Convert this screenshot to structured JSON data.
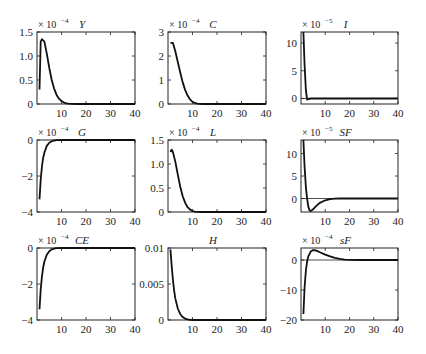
{
  "chart_data": [
    {
      "type": "line",
      "title": "Y",
      "exponent": "-4",
      "xlim": [
        0,
        40
      ],
      "ylim": [
        0,
        1.5
      ],
      "xticks": [
        10,
        20,
        30,
        40
      ],
      "yticks": [
        0,
        0.5,
        1.0,
        1.5
      ],
      "ytick_labels": [
        "0",
        "0.5",
        "1.0",
        "1.5"
      ],
      "zero_line": false,
      "x": [
        1,
        1.5,
        2,
        3,
        4,
        5,
        6,
        7,
        8,
        9,
        10,
        11,
        12,
        13,
        14,
        16,
        20,
        30,
        40
      ],
      "values": [
        0.3,
        1.3,
        1.35,
        1.3,
        1.05,
        0.75,
        0.5,
        0.32,
        0.19,
        0.11,
        0.06,
        0.03,
        0.015,
        0.006,
        0.002,
        0,
        0,
        0,
        0
      ]
    },
    {
      "type": "line",
      "title": "C",
      "exponent": "-4",
      "xlim": [
        0,
        40
      ],
      "ylim": [
        0,
        3
      ],
      "xticks": [
        10,
        20,
        30,
        40
      ],
      "yticks": [
        0,
        1,
        2,
        3
      ],
      "ytick_labels": [
        "0",
        "1",
        "2",
        "3"
      ],
      "zero_line": false,
      "x": [
        1,
        2,
        3,
        4,
        5,
        6,
        7,
        8,
        9,
        10,
        11,
        12,
        13,
        14,
        16,
        20,
        30,
        40
      ],
      "values": [
        2.55,
        2.55,
        2.2,
        1.75,
        1.3,
        0.9,
        0.58,
        0.35,
        0.19,
        0.09,
        0.04,
        0.015,
        0.005,
        0,
        0,
        0,
        0,
        0
      ]
    },
    {
      "type": "line",
      "title": "I",
      "exponent": "-5",
      "xlim": [
        0,
        40
      ],
      "ylim": [
        -1,
        12
      ],
      "xticks": [
        10,
        20,
        30,
        40
      ],
      "yticks": [
        0,
        5,
        10
      ],
      "ytick_labels": [
        "0",
        "5",
        "10"
      ],
      "zero_line": true,
      "x": [
        1,
        1.5,
        2,
        2.5,
        3,
        4,
        6,
        10,
        20,
        40
      ],
      "values": [
        12,
        6,
        1.5,
        -0.2,
        -0.1,
        0,
        0,
        0,
        0,
        0
      ]
    },
    {
      "type": "line",
      "title": "G",
      "exponent": "-4",
      "xlim": [
        0,
        40
      ],
      "ylim": [
        -4,
        0
      ],
      "xticks": [
        10,
        20,
        30,
        40
      ],
      "yticks": [
        -4,
        -2,
        0
      ],
      "ytick_labels": [
        "-4",
        "-2",
        "0"
      ],
      "zero_line": false,
      "x": [
        1,
        1.5,
        2,
        2.5,
        3,
        4,
        5,
        6,
        7,
        8,
        10,
        20,
        40
      ],
      "values": [
        -3.3,
        -2.2,
        -1.5,
        -1.0,
        -0.7,
        -0.33,
        -0.15,
        -0.07,
        -0.03,
        -0.01,
        0,
        0,
        0
      ]
    },
    {
      "type": "line",
      "title": "L",
      "exponent": "-4",
      "xlim": [
        0,
        40
      ],
      "ylim": [
        0,
        1.5
      ],
      "xticks": [
        10,
        20,
        30,
        40
      ],
      "yticks": [
        0,
        0.5,
        1.0,
        1.5
      ],
      "ytick_labels": [
        "0",
        "0.5",
        "1.0",
        "1.5"
      ],
      "zero_line": false,
      "x": [
        1,
        1.5,
        2,
        3,
        4,
        5,
        6,
        7,
        8,
        9,
        10,
        11,
        12,
        14,
        20,
        30,
        40
      ],
      "values": [
        1.25,
        1.3,
        1.25,
        1.05,
        0.78,
        0.52,
        0.33,
        0.19,
        0.1,
        0.05,
        0.02,
        0.008,
        0.002,
        0,
        0,
        0,
        0
      ]
    },
    {
      "type": "line",
      "title": "SF",
      "exponent": "-5",
      "xlim": [
        0,
        40
      ],
      "ylim": [
        -3,
        13
      ],
      "xticks": [
        10,
        20,
        30,
        40
      ],
      "yticks": [
        0,
        5,
        10
      ],
      "ytick_labels": [
        "0",
        "5",
        "10"
      ],
      "zero_line": true,
      "x": [
        1,
        1.5,
        2,
        2.5,
        3,
        3.5,
        4,
        5,
        6,
        7,
        8,
        10,
        12,
        14,
        16,
        20,
        30,
        40
      ],
      "values": [
        13,
        7,
        2.5,
        0,
        -1.8,
        -2.6,
        -2.8,
        -2.4,
        -1.8,
        -1.3,
        -0.9,
        -0.4,
        -0.15,
        -0.05,
        0,
        0,
        0,
        0
      ]
    },
    {
      "type": "line",
      "title": "CE",
      "exponent": "-4",
      "xlim": [
        0,
        40
      ],
      "ylim": [
        -4,
        0
      ],
      "xticks": [
        10,
        20,
        30,
        40
      ],
      "yticks": [
        -4,
        -2,
        0
      ],
      "ytick_labels": [
        "-4",
        "-2",
        "0"
      ],
      "zero_line": false,
      "x": [
        1,
        1.5,
        2,
        2.5,
        3,
        4,
        5,
        6,
        7,
        8,
        10,
        20,
        40
      ],
      "values": [
        -3.4,
        -2.3,
        -1.6,
        -1.1,
        -0.75,
        -0.37,
        -0.18,
        -0.08,
        -0.035,
        -0.012,
        0,
        0,
        0
      ]
    },
    {
      "type": "line",
      "title": "H",
      "exponent": "",
      "xlim": [
        0,
        40
      ],
      "ylim": [
        0,
        0.01
      ],
      "xticks": [
        10,
        20,
        30,
        40
      ],
      "yticks": [
        0,
        0.005,
        0.01
      ],
      "ytick_labels": [
        "0",
        "0.005",
        "0.01"
      ],
      "zero_line": false,
      "x": [
        1,
        1.5,
        2,
        2.5,
        3,
        4,
        5,
        6,
        7,
        8,
        9,
        10,
        20,
        40
      ],
      "values": [
        0.0098,
        0.0075,
        0.0056,
        0.0041,
        0.003,
        0.0016,
        0.0008,
        0.0004,
        0.00018,
        8e-05,
        3e-05,
        0,
        0,
        0
      ]
    },
    {
      "type": "line",
      "title": "sF",
      "exponent": "-4",
      "xlim": [
        0,
        40
      ],
      "ylim": [
        -20,
        4
      ],
      "xticks": [
        10,
        20,
        30,
        40
      ],
      "yticks": [
        -20,
        -10,
        0
      ],
      "ytick_labels": [
        "-20",
        "-10",
        "0"
      ],
      "zero_line": true,
      "x": [
        1,
        1.5,
        2,
        2.5,
        3,
        4,
        5,
        6,
        7,
        8,
        10,
        12,
        14,
        16,
        18,
        20,
        25,
        30,
        40
      ],
      "values": [
        -18,
        -9,
        -3.5,
        -0.5,
        1.2,
        2.8,
        3.3,
        3.2,
        2.9,
        2.5,
        1.8,
        1.2,
        0.7,
        0.35,
        0.12,
        0.03,
        0,
        0,
        0
      ]
    }
  ]
}
